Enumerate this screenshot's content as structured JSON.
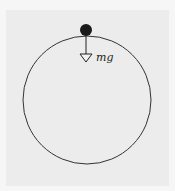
{
  "diagram": {
    "type": "free-body diagram",
    "force_label": "mg",
    "colors": {
      "background": "#ececec",
      "outer": "#f6f6f6",
      "stroke": "#333333",
      "ball": "#1a1a1a"
    },
    "circle": {
      "cx": 87,
      "cy": 100,
      "r": 64
    },
    "ball": {
      "cx": 86,
      "cy": 30,
      "r": 6
    },
    "arrow": {
      "x": 86,
      "y1": 30,
      "y2": 62,
      "direction": "down"
    }
  }
}
